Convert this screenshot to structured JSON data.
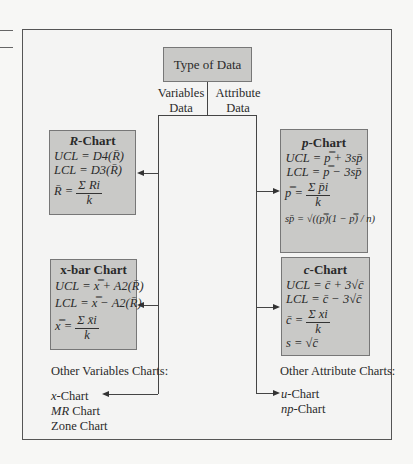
{
  "root": {
    "label": "Type of Data"
  },
  "branches": {
    "left_label_1": "Variables",
    "left_label_2": "Data",
    "right_label_1": "Attribute",
    "right_label_2": "Data"
  },
  "r_chart": {
    "title_var": "R",
    "title_rest": "-Chart",
    "ucl": "UCL = D4(R̄)",
    "lcl": "LCL = D3(R̄)",
    "center_lhs": "R̄ =",
    "center_num": "Σ Ri",
    "center_den": "k"
  },
  "xbar_chart": {
    "title": "x-bar Chart",
    "ucl": "UCL = x̿ + A2(R̄)",
    "lcl": "LCL = x̿ − A2(R̄)",
    "center_lhs": "x̿ =",
    "center_num": "Σ x̄i",
    "center_den": "k"
  },
  "p_chart": {
    "title_var": "p",
    "title_rest": "-Chart",
    "ucl": "UCL = p̿ + 3sp̄",
    "lcl": "LCL = p̿ − 3sp̄",
    "center_lhs": "p̿ =",
    "center_num": "Σ p̄i",
    "center_den": "k",
    "s": "sp̄ = √((p̿)(1 − p̿) / n)"
  },
  "c_chart": {
    "title_var": "c",
    "title_rest": "-Chart",
    "ucl": "UCL = c̄ + 3√c̄",
    "lcl": "LCL = c̄ − 3√c̄",
    "center_lhs": "c̄ =",
    "center_num": "Σ xi",
    "center_den": "k",
    "s": "s = √c̄"
  },
  "other_variables": {
    "heading": "Other Variables Charts:",
    "items": [
      "x-Chart",
      "MR Chart",
      "Zone Chart"
    ]
  },
  "other_attribute": {
    "heading": "Other Attribute Charts:",
    "items": [
      "u-Chart",
      "np-Chart"
    ]
  }
}
